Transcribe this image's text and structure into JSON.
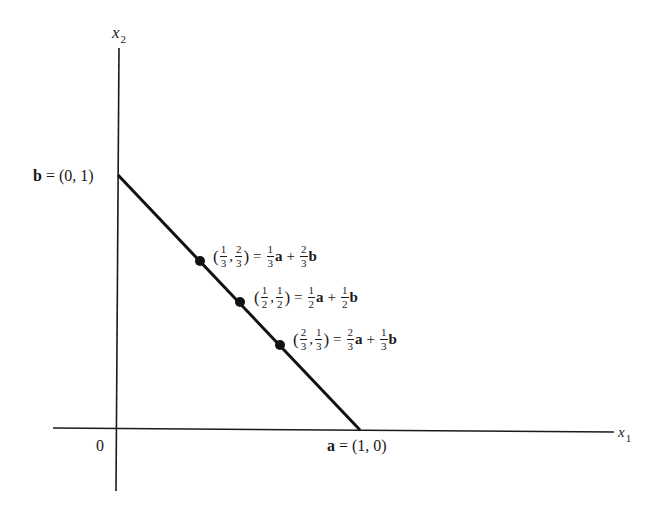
{
  "diagram": {
    "type": "line-segment-convex-combination",
    "axes": {
      "x_label": "x",
      "x_label_sub": "1",
      "y_label": "x",
      "y_label_sub": "2",
      "origin_label": "0"
    },
    "endpoints": {
      "b": {
        "name": "b",
        "eq": "=",
        "coords": "(0, 1)"
      },
      "a": {
        "name": "a",
        "eq": "=",
        "coords": "(1, 0)"
      }
    },
    "points": [
      {
        "x_num": "1",
        "x_den": "3",
        "y_num": "2",
        "y_den": "3",
        "a_num": "1",
        "a_den": "3",
        "b_num": "2",
        "b_den": "3",
        "a": "a",
        "b": "b",
        "eq": "=",
        "plus": "+"
      },
      {
        "x_num": "1",
        "x_den": "2",
        "y_num": "1",
        "y_den": "2",
        "a_num": "1",
        "a_den": "2",
        "b_num": "1",
        "b_den": "2",
        "a": "a",
        "b": "b",
        "eq": "=",
        "plus": "+"
      },
      {
        "x_num": "2",
        "x_den": "3",
        "y_num": "1",
        "y_den": "3",
        "a_num": "2",
        "a_den": "3",
        "b_num": "1",
        "b_den": "3",
        "a": "a",
        "b": "b",
        "eq": "=",
        "plus": "+"
      }
    ],
    "colors": {
      "ink": "#1a1a1a",
      "background": "#ffffff"
    }
  }
}
